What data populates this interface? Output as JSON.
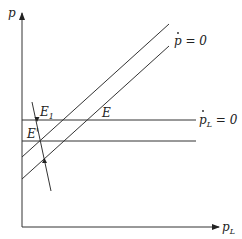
{
  "diagram": {
    "type": "phase-diagram",
    "axes": {
      "y_label": "p",
      "x_label": "p",
      "x_label_sub": "L"
    },
    "curves": {
      "pdot_zero_label": "p = 0",
      "pLdot_zero_label_main": "p",
      "pLdot_zero_label_sub": "L",
      "pLdot_zero_label_eq": " = 0"
    },
    "points": {
      "E": "E",
      "E1_main": "E",
      "E1_sub": "1",
      "E_prime": "E'"
    },
    "colors": {
      "line": "#333333",
      "background": "#ffffff"
    }
  }
}
